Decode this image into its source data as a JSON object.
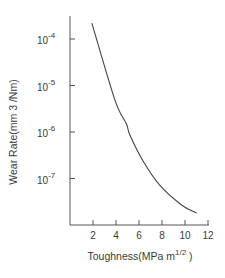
{
  "chart_data": {
    "type": "line",
    "title": "",
    "xlabel": "Toughness(MPa m^1/2 )",
    "xlabel_main": "Toughness(MPa  m",
    "xlabel_sup": "1/2",
    "xlabel_tail": " )",
    "ylabel": "Wear  Rate(mm 3  /Nm)",
    "yscale": "log",
    "xlim": [
      0,
      12
    ],
    "ylim": [
      1e-08,
      0.0003
    ],
    "grid": false,
    "legend": null,
    "x_ticks": [
      2,
      4,
      6,
      8,
      10,
      12
    ],
    "y_ticks": [
      {
        "base": "10",
        "exp": "-4",
        "value": 0.0001
      },
      {
        "base": "10",
        "exp": "-5",
        "value": 1e-05
      },
      {
        "base": "10",
        "exp": "-6",
        "value": 1e-06
      },
      {
        "base": "10",
        "exp": "-7",
        "value": 1e-07
      }
    ],
    "series": [
      {
        "name": "Wear rate",
        "color": "#444444",
        "x": [
          1.9,
          3.9,
          4.9,
          5.2,
          6.3,
          7.8,
          9.7,
          11.0
        ],
        "values": [
          0.00022,
          4.9e-06,
          1.5e-06,
          8.7e-07,
          2.5e-07,
          7.2e-08,
          2.7e-08,
          1.8e-08
        ]
      }
    ]
  }
}
